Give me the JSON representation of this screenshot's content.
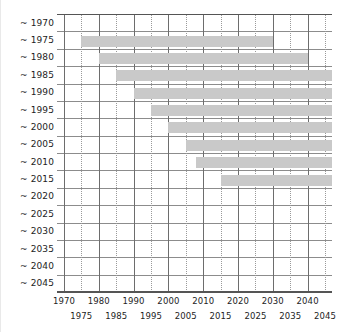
{
  "chart_data": {
    "type": "bar",
    "orientation": "horizontal",
    "title": "",
    "subtitle": "",
    "xlabel": "",
    "ylabel": "",
    "xlim": [
      1968,
      2047
    ],
    "ylim": [
      1970,
      2045
    ],
    "grid": true,
    "legend": null,
    "legend_position": "none",
    "bar_color": "#c9c9c9",
    "axis_color": "#555555",
    "gridline_major_color": "#6d6d6d",
    "gridline_minor_color": "#9a9a9a",
    "x_tick_major": [
      1970,
      1980,
      1990,
      2000,
      2010,
      2020,
      2030,
      2040
    ],
    "x_tick_minor": [
      1975,
      1985,
      1995,
      2005,
      2015,
      2025,
      2035,
      2045
    ],
    "x_tick_labels_row1": [
      "1970",
      "1980",
      "1990",
      "2000",
      "2010",
      "2020",
      "2030",
      "2040"
    ],
    "x_tick_labels_row2": [
      "1975",
      "1985",
      "1995",
      "2005",
      "2015",
      "2025",
      "2035",
      "2045"
    ],
    "categories": [
      "~ 1970",
      "~ 1975",
      "~ 1980",
      "~ 1985",
      "~ 1990",
      "~ 1995",
      "~ 2000",
      "~ 2005",
      "~ 2010",
      "~ 2015",
      "~ 2020",
      "~ 2025",
      "~ 2030",
      "~ 2035",
      "~ 2040",
      "~ 2045"
    ],
    "bars": [
      {
        "category": "~ 1970",
        "start": null,
        "end": null,
        "visible": false
      },
      {
        "category": "~ 1975",
        "start": 1975,
        "end": 2030,
        "visible": true
      },
      {
        "category": "~ 1980",
        "start": 1980,
        "end": 2040,
        "visible": true
      },
      {
        "category": "~ 1985",
        "start": 1985,
        "end": 2047,
        "visible": true
      },
      {
        "category": "~ 1990",
        "start": 1990,
        "end": 2047,
        "visible": true
      },
      {
        "category": "~ 1995",
        "start": 1995,
        "end": 2047,
        "visible": true
      },
      {
        "category": "~ 2000",
        "start": 2000,
        "end": 2047,
        "visible": true
      },
      {
        "category": "~ 2005",
        "start": 2005,
        "end": 2047,
        "visible": true
      },
      {
        "category": "~ 2010",
        "start": 2008,
        "end": 2047,
        "visible": true
      },
      {
        "category": "~ 2015",
        "start": 2015,
        "end": 2047,
        "visible": true
      },
      {
        "category": "~ 2020",
        "start": null,
        "end": null,
        "visible": false
      },
      {
        "category": "~ 2025",
        "start": null,
        "end": null,
        "visible": false
      },
      {
        "category": "~ 2030",
        "start": null,
        "end": null,
        "visible": false
      },
      {
        "category": "~ 2035",
        "start": null,
        "end": null,
        "visible": false
      },
      {
        "category": "~ 2040",
        "start": null,
        "end": null,
        "visible": false
      },
      {
        "category": "~ 2045",
        "start": null,
        "end": null,
        "visible": false
      }
    ]
  }
}
